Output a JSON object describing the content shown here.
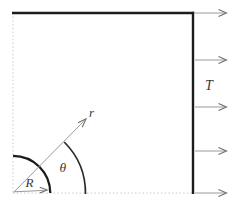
{
  "colors": {
    "ink": "#1c1c1c",
    "arrow": "#9a9a9a",
    "arrowhead": "#6f6f6f",
    "faint": "#c4c4c4",
    "label": "#3a3a3a",
    "background": "#ffffff"
  },
  "diagram": {
    "labels": {
      "tension": "T",
      "radial_coordinate": "r",
      "angle": "θ",
      "hole_radius": "R"
    },
    "tension_arrows": {
      "count": 5,
      "ys": [
        13,
        60,
        107,
        151,
        193
      ],
      "x_start": 195,
      "x_tip": 226.5
    }
  }
}
